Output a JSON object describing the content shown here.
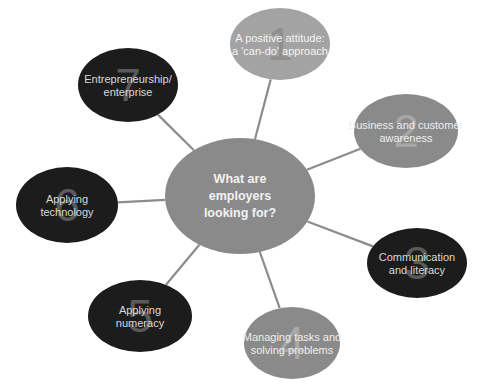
{
  "center": {
    "lines": [
      "What are",
      "employers",
      "looking for?"
    ],
    "fill": "#8a8a8a",
    "text_color": "#f2f2f2"
  },
  "nodes": [
    {
      "number": "1",
      "lines": [
        "A positive attitude:",
        "a 'can-do' approach"
      ],
      "fill": "#a3a3a3",
      "number_color": "#8f8f8f",
      "text_color": "#f4f4f4"
    },
    {
      "number": "2",
      "lines": [
        "Business and customer",
        "awareness"
      ],
      "fill": "#8a8a8a",
      "number_color": "#a6a6a6",
      "text_color": "#eeeeee"
    },
    {
      "number": "3",
      "lines": [
        "Communication",
        "and literacy"
      ],
      "fill": "#1c1c1c",
      "number_color": "#5a5a5a",
      "text_color": "#d9d9d9"
    },
    {
      "number": "4",
      "lines": [
        "Managing tasks and",
        "solving problems"
      ],
      "fill": "#8a8a8a",
      "number_color": "#a8a8a8",
      "text_color": "#eeeeee"
    },
    {
      "number": "5",
      "lines": [
        "Applying",
        "numeracy"
      ],
      "fill": "#1c1c1c",
      "number_color": "#5a5a5a",
      "text_color": "#d9d9d9"
    },
    {
      "number": "6",
      "lines": [
        "Applying",
        "technology"
      ],
      "fill": "#1c1c1c",
      "number_color": "#5a5a5a",
      "text_color": "#d9d9d9"
    },
    {
      "number": "7",
      "lines": [
        "Entrepreneurship/",
        "enterprise"
      ],
      "fill": "#1c1c1c",
      "number_color": "#5a5a5a",
      "text_color": "#d9d9d9"
    }
  ],
  "connector_color": "#8c8c8c"
}
